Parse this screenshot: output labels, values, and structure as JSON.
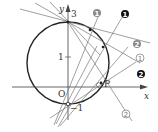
{
  "diagram": {
    "axes": {
      "x_label": "x",
      "y_label": "y",
      "origin_label": "O"
    },
    "ticks": {
      "y_top": "3",
      "y_one": "1",
      "y_neg": "−1"
    },
    "point_label": "P",
    "line_tags": [
      {
        "id": "gray-1",
        "text": "1",
        "style": "gray-filled"
      },
      {
        "id": "black-1",
        "text": "1",
        "style": "black-filled"
      },
      {
        "id": "gray-2",
        "text": "2",
        "style": "gray-filled"
      },
      {
        "id": "outline-1",
        "text": "1",
        "style": "outline"
      },
      {
        "id": "black-2",
        "text": "2",
        "style": "black-filled"
      },
      {
        "id": "outline-2",
        "text": "2",
        "style": "outline"
      }
    ],
    "colors": {
      "line": "#555555",
      "circle": "#222222",
      "gray_tag": "#8a8a8a",
      "black_tag": "#111111"
    }
  }
}
